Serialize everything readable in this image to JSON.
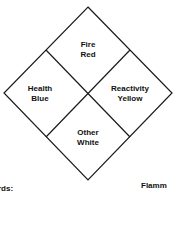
{
  "diagram": {
    "quadrants": [
      {
        "id": "fire",
        "line1": "Fire",
        "line2": "Red"
      },
      {
        "id": "health",
        "line1": "Health",
        "line2": "Blue"
      },
      {
        "id": "reactivity",
        "line1": "Reactivity",
        "line2": "Yellow"
      },
      {
        "id": "other",
        "line1": "Other",
        "line2": "White"
      }
    ],
    "footer_left": "rds:",
    "footer_right": "Flamm",
    "line_color": "#1a1a1a"
  }
}
